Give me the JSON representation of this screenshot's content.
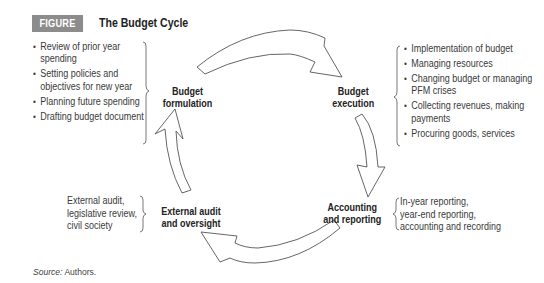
{
  "figure": {
    "label": "FIGURE 8.2",
    "title": "The Budget Cycle",
    "label_bg_color": "#8c8c8c"
  },
  "stages": {
    "formulation": {
      "line1": "Budget",
      "line2": "formulation"
    },
    "execution": {
      "line1": "Budget",
      "line2": "execution"
    },
    "accounting": {
      "line1": "Accounting",
      "line2": "and reporting"
    },
    "audit": {
      "line1": "External audit",
      "line2": "and oversight"
    }
  },
  "details": {
    "formulation": [
      "Review of prior year spending",
      "Setting policies and objectives for new year",
      "Planning future spending",
      "Drafting budget document"
    ],
    "execution": [
      "Implementation of budget",
      "Managing resources",
      "Changing budget or managing PFM crises",
      "Collecting revenues, making payments",
      "Procuring goods, services"
    ],
    "accounting": {
      "line1": "In-year reporting,",
      "line2": "year-end reporting,",
      "line3": "accounting and recording"
    },
    "audit": {
      "line1": "External audit,",
      "line2": "legislative review,",
      "line3": "civil society"
    }
  },
  "source": {
    "label": "Source:",
    "text": " Authors."
  },
  "arrows": [
    {
      "from": "formulation",
      "to": "execution"
    },
    {
      "from": "execution",
      "to": "accounting"
    },
    {
      "from": "accounting",
      "to": "audit"
    },
    {
      "from": "audit",
      "to": "formulation"
    }
  ]
}
